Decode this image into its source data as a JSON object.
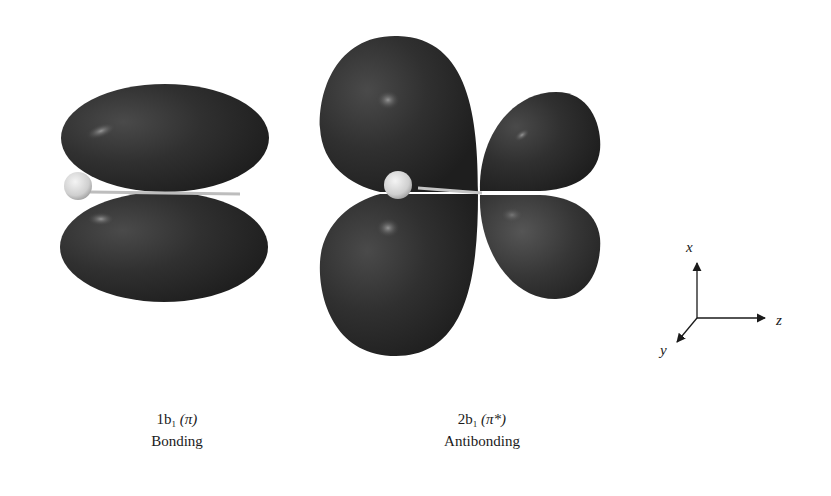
{
  "figure": {
    "orbitals": [
      {
        "id": "1b1",
        "label_prefix": "1b",
        "label_subscript": "1",
        "label_symmetry": "(π)",
        "description": "Bonding"
      },
      {
        "id": "2b1",
        "label_prefix": "2b",
        "label_subscript": "1",
        "label_symmetry": "(π*)",
        "description": "Antibonding"
      }
    ],
    "axes": {
      "x_label": "x",
      "y_label": "y",
      "z_label": "z"
    },
    "colors": {
      "lobe": "#2e2e2e",
      "lobe_highlight": "#6a6a6a",
      "atom": "#d8d8d8",
      "background": "#ffffff"
    }
  }
}
